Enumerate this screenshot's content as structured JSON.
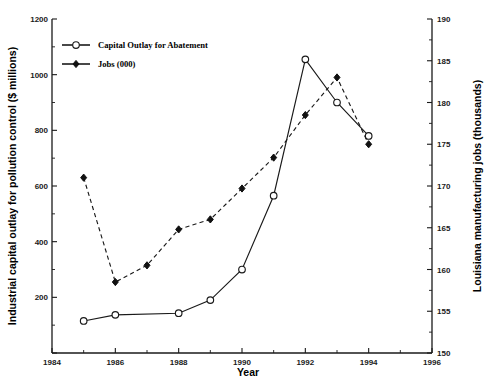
{
  "chart_data": {
    "type": "line",
    "title": "",
    "xlabel": "Year",
    "ylabel": "Industrial capital outlay for pollution control ($ millions)",
    "y2label": "Louisiana manufacturing jobs (thousands)",
    "xlim": [
      1984,
      1996
    ],
    "ylim": [
      0,
      1200
    ],
    "y2lim": [
      150,
      190
    ],
    "xticks": [
      1984,
      1986,
      1988,
      1990,
      1992,
      1994,
      1996
    ],
    "xticklabels": [
      "1984",
      "1986",
      "1988",
      "1990",
      "1992",
      "1994",
      "1996"
    ],
    "yticks": [
      0,
      200,
      400,
      600,
      800,
      1000,
      1200
    ],
    "yticklabels": [
      "",
      "200",
      "400",
      "600",
      "800",
      "1000",
      "1200"
    ],
    "y2ticks": [
      150,
      155,
      160,
      165,
      170,
      175,
      180,
      185,
      190
    ],
    "y2ticklabels": [
      "150",
      "155",
      "160",
      "165",
      "170",
      "175",
      "180",
      "185",
      "190"
    ],
    "grid": false,
    "legend_position": "upper left",
    "series": [
      {
        "name": "Capital Outlay for Abatement",
        "axis": "left",
        "marker": "open-circle",
        "linestyle": "solid",
        "color": "#1a1a1a",
        "x": [
          1985,
          1986,
          1988,
          1989,
          1990,
          1991,
          1992,
          1993,
          1994
        ],
        "values": [
          115,
          137,
          143,
          190,
          300,
          565,
          1055,
          900,
          780
        ]
      },
      {
        "name": "Jobs (000)",
        "axis": "right",
        "marker": "filled-diamond",
        "linestyle": "dashed",
        "color": "#111111",
        "x": [
          1985,
          1986,
          1987,
          1988,
          1989,
          1990,
          1991,
          1992,
          1993,
          1994
        ],
        "values": [
          171.0,
          158.5,
          160.5,
          164.8,
          166.0,
          169.7,
          173.4,
          178.5,
          183.0,
          175.0
        ]
      }
    ]
  },
  "legend": {
    "items": [
      {
        "label": "Capital Outlay for Abatement",
        "marker": "open-circle",
        "linestyle": "solid"
      },
      {
        "label": "Jobs (000)",
        "marker": "filled-diamond",
        "linestyle": "solid"
      }
    ]
  },
  "axes": {
    "x_label": "Year",
    "y_left_label": "Industrial capital outlay for pollution control ($ millions)",
    "y_right_label": "Louisiana manufacturing jobs (thousands)"
  }
}
